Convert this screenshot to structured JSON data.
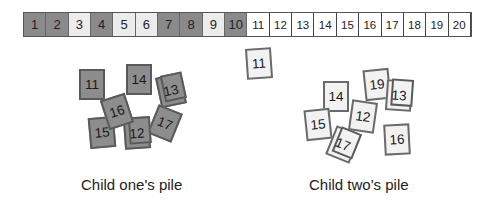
{
  "strip": {
    "cells": [
      {
        "n": "1",
        "tone": "dark"
      },
      {
        "n": "2",
        "tone": "dark"
      },
      {
        "n": "3",
        "tone": "light"
      },
      {
        "n": "4",
        "tone": "dark"
      },
      {
        "n": "5",
        "tone": "light"
      },
      {
        "n": "6",
        "tone": "light"
      },
      {
        "n": "7",
        "tone": "dark"
      },
      {
        "n": "8",
        "tone": "dark"
      },
      {
        "n": "9",
        "tone": "light"
      },
      {
        "n": "10",
        "tone": "dark"
      },
      {
        "n": "11",
        "tone": "white"
      },
      {
        "n": "12",
        "tone": "white"
      },
      {
        "n": "13",
        "tone": "white"
      },
      {
        "n": "14",
        "tone": "white"
      },
      {
        "n": "15",
        "tone": "white"
      },
      {
        "n": "16",
        "tone": "white"
      },
      {
        "n": "17",
        "tone": "white"
      },
      {
        "n": "18",
        "tone": "white"
      },
      {
        "n": "19",
        "tone": "white"
      },
      {
        "n": "20",
        "tone": "white"
      }
    ]
  },
  "loose_card": {
    "n": "11",
    "tone": "light",
    "x": 246,
    "y": 48,
    "rot": -4
  },
  "pile_one": {
    "label": "Child one's pile",
    "cards": [
      {
        "n": "11",
        "x": 79,
        "y": 69,
        "rot": 0
      },
      {
        "n": "14",
        "x": 126,
        "y": 64,
        "rot": 0
      },
      {
        "n": "13",
        "x": 158,
        "y": 75,
        "rot": -12,
        "shadow": true
      },
      {
        "n": "17",
        "x": 152,
        "y": 108,
        "rot": 22
      },
      {
        "n": "15",
        "x": 89,
        "y": 117,
        "rot": -5
      },
      {
        "n": "12",
        "x": 124,
        "y": 118,
        "rot": -4,
        "shadow": true
      },
      {
        "n": "16",
        "x": 104,
        "y": 96,
        "rot": -18
      }
    ]
  },
  "pile_two": {
    "label": "Child two's pile",
    "cards": [
      {
        "n": "14",
        "x": 323,
        "y": 81,
        "rot": 0
      },
      {
        "n": "19",
        "x": 364,
        "y": 69,
        "rot": -6
      },
      {
        "n": "13",
        "x": 386,
        "y": 80,
        "rot": 4,
        "shadow": true
      },
      {
        "n": "15",
        "x": 305,
        "y": 109,
        "rot": -6
      },
      {
        "n": "12",
        "x": 350,
        "y": 101,
        "rot": 8
      },
      {
        "n": "16",
        "x": 384,
        "y": 124,
        "rot": -3
      },
      {
        "n": "17",
        "x": 330,
        "y": 129,
        "rot": 22,
        "shadow": true
      }
    ]
  }
}
